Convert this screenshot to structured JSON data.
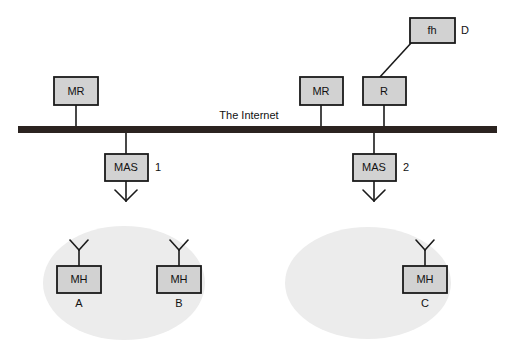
{
  "diagram": {
    "title_text": "The Internet",
    "colors": {
      "box_fill": "#d2d2d2",
      "box_stroke": "#1a1a1a",
      "cell_fill": "#ececec",
      "backbone": "#2b2320",
      "line": "#1a1a1a",
      "text": "#111111",
      "background": "#ffffff"
    },
    "backbone": {
      "label": "The Internet",
      "x": 18,
      "y": 126,
      "width": 479,
      "height": 7
    },
    "nodes": [
      {
        "id": "mr-left",
        "label": "MR",
        "x": 54,
        "y": 77,
        "width": 44,
        "height": 28,
        "side_label": ""
      },
      {
        "id": "mr-right",
        "label": "MR",
        "x": 300,
        "y": 77,
        "width": 43,
        "height": 28,
        "side_label": ""
      },
      {
        "id": "router",
        "label": "R",
        "x": 363,
        "y": 77,
        "width": 43,
        "height": 28,
        "side_label": ""
      },
      {
        "id": "fixed-host",
        "label": "fh",
        "x": 410,
        "y": 18,
        "width": 45,
        "height": 25,
        "side_label": "D"
      },
      {
        "id": "mas-1",
        "label": "MAS",
        "x": 105,
        "y": 154,
        "width": 43,
        "height": 27,
        "side_label": "1"
      },
      {
        "id": "mas-2",
        "label": "MAS",
        "x": 353,
        "y": 154,
        "width": 43,
        "height": 27,
        "side_label": "2"
      },
      {
        "id": "mh-a",
        "label": "MH",
        "x": 57,
        "y": 266,
        "width": 44,
        "height": 27,
        "side_label": "",
        "under_label": "A"
      },
      {
        "id": "mh-b",
        "label": "MH",
        "x": 157,
        "y": 266,
        "width": 44,
        "height": 27,
        "side_label": "",
        "under_label": "B"
      },
      {
        "id": "mh-c",
        "label": "MH",
        "x": 403,
        "y": 266,
        "width": 44,
        "height": 27,
        "side_label": "",
        "under_label": "C"
      }
    ],
    "cells": [
      {
        "id": "cell-left",
        "cx": 124,
        "cy": 283,
        "rx": 81,
        "ry": 57
      },
      {
        "id": "cell-right",
        "cx": 368,
        "cy": 283,
        "rx": 83,
        "ry": 56
      }
    ],
    "links": [
      {
        "id": "link-mr-left-backbone",
        "from": "mr-left",
        "to": "backbone"
      },
      {
        "id": "link-mr-right-backbone",
        "from": "mr-right",
        "to": "backbone"
      },
      {
        "id": "link-router-backbone",
        "from": "router",
        "to": "backbone"
      },
      {
        "id": "link-fh-router",
        "from": "fixed-host",
        "to": "router"
      },
      {
        "id": "link-backbone-mas1",
        "from": "backbone",
        "to": "mas-1"
      },
      {
        "id": "link-backbone-mas2",
        "from": "backbone",
        "to": "mas-2"
      }
    ],
    "antennas": [
      {
        "id": "antenna-mas-1",
        "orientation": "down",
        "x": 126,
        "y": 181
      },
      {
        "id": "antenna-mas-2",
        "orientation": "down",
        "x": 374,
        "y": 181
      },
      {
        "id": "antenna-mh-a",
        "orientation": "up",
        "x": 79,
        "y": 266
      },
      {
        "id": "antenna-mh-b",
        "orientation": "up",
        "x": 179,
        "y": 266
      },
      {
        "id": "antenna-mh-c",
        "orientation": "up",
        "x": 425,
        "y": 266
      }
    ]
  }
}
